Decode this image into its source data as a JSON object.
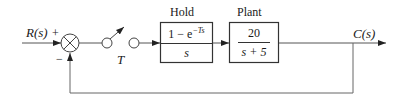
{
  "diagram": {
    "type": "sampled-data feedback control block diagram",
    "input": {
      "label": "R(s)",
      "sign": "+"
    },
    "summing_junction": {
      "feedback_sign": "−"
    },
    "sampler": {
      "label": "T"
    },
    "hold": {
      "title": "Hold",
      "numerator_prefix": "1 − e",
      "numerator_exponent": "−Ts",
      "denominator": "s"
    },
    "plant": {
      "title": "Plant",
      "numerator": "20",
      "denominator": "s + 5"
    },
    "output": {
      "label": "C(s)"
    },
    "colors": {
      "line": "#555555",
      "text": "#1a1a1a",
      "background": "#ffffff"
    }
  }
}
